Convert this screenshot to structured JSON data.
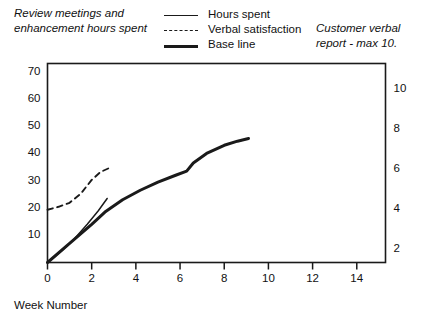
{
  "header": {
    "left_caption": "Review meetings and enhancement hours spent",
    "right_caption": "Customer verbal report - max 10."
  },
  "legend": {
    "position": "top-center",
    "items": [
      {
        "label": "Hours spent",
        "style": "solid-thin",
        "color": "#1a1a1a"
      },
      {
        "label": "Verbal satisfaction",
        "style": "dashed",
        "color": "#1a1a1a"
      },
      {
        "label": "Base line",
        "style": "solid-thick",
        "color": "#1a1a1a"
      }
    ]
  },
  "chart_data": {
    "type": "line",
    "title": "",
    "xlabel": "Week Number",
    "ylabel": "Review meetings and enhancement hours spent",
    "y2label": "Customer verbal report - max 10.",
    "xlim": [
      0,
      15.3
    ],
    "ylim": [
      0,
      73
    ],
    "y2lim": [
      1.3,
      11.3
    ],
    "xticks": [
      0,
      2,
      4,
      6,
      8,
      10,
      12,
      14
    ],
    "xticklabels": [
      "0",
      "2",
      "4",
      "6",
      "8",
      "10",
      "12",
      "14"
    ],
    "yticks": [
      10,
      20,
      30,
      40,
      50,
      60,
      70
    ],
    "yticklabels": [
      "10",
      "20",
      "30",
      "40",
      "50",
      "60",
      "70"
    ],
    "y2ticks": [
      2,
      4,
      6,
      8,
      10
    ],
    "y2ticklabels": [
      "2",
      "4",
      "6",
      "8",
      "10"
    ],
    "grid": false,
    "series": [
      {
        "name": "Hours spent",
        "axis": "left",
        "style": "solid-thin",
        "color": "#1a1a1a",
        "x": [
          0.0,
          0.6,
          1.2,
          1.8,
          2.3,
          2.7
        ],
        "y": [
          0.0,
          4.0,
          8.5,
          14.0,
          19.0,
          23.5
        ]
      },
      {
        "name": "Verbal satisfaction",
        "axis": "right",
        "style": "dashed",
        "color": "#1a1a1a",
        "x": [
          0.0,
          0.5,
          1.0,
          1.5,
          2.0,
          2.4,
          2.8
        ],
        "y": [
          3.95,
          4.1,
          4.3,
          4.75,
          5.45,
          5.85,
          6.05
        ]
      },
      {
        "name": "Base line",
        "axis": "left",
        "style": "solid-thick",
        "color": "#1a1a1a",
        "x": [
          0.0,
          1.0,
          2.0,
          2.6,
          3.4,
          4.2,
          5.0,
          5.8,
          6.3,
          6.6,
          7.2,
          8.0,
          8.6,
          9.1
        ],
        "y": [
          0.0,
          7.0,
          14.0,
          18.5,
          23.0,
          26.5,
          29.5,
          32.0,
          33.5,
          36.5,
          40.0,
          43.0,
          44.5,
          45.5
        ]
      }
    ]
  }
}
